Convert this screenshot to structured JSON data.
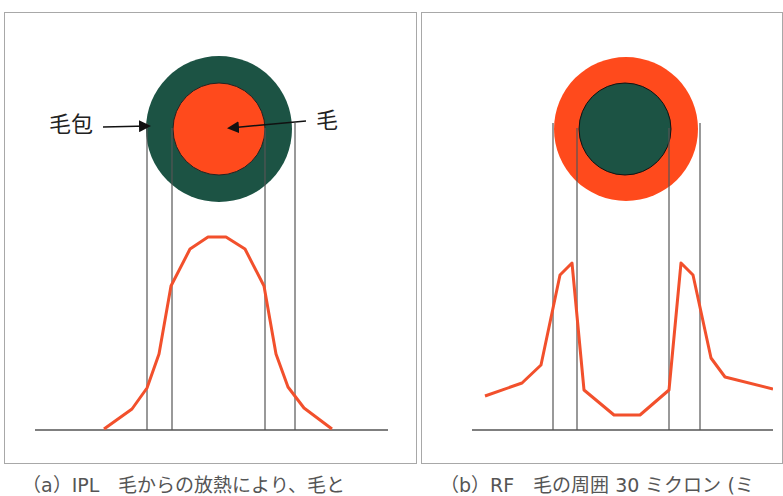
{
  "colors": {
    "follicle_green": "#1c5344",
    "hair_orange": "#ff4a1c",
    "curve_orange": "#f2502c",
    "line_gray": "#555555",
    "border_gray": "#a8a8a8"
  },
  "panel_a": {
    "labels": {
      "follicle": "毛包",
      "hair": "毛"
    },
    "outer_circle": {
      "cx": 219,
      "cy": 129,
      "r": 73,
      "fill": "follicle"
    },
    "inner_circle": {
      "cx": 219,
      "cy": 129,
      "r": 46,
      "fill": "hair"
    },
    "guide_lines_x": [
      147,
      172,
      265,
      295
    ],
    "baseline": {
      "x1": 35,
      "x2": 388,
      "y": 430
    },
    "curve_points": "104,429 132,409 147,388 159,354 171,286 190,249 208,237 226,237 245,249 264,286 276,354 288,387 304,408 332,429",
    "caption": "（a）IPL　毛からの放熱により、毛と"
  },
  "panel_b": {
    "outer_circle": {
      "cx": 626,
      "cy": 129,
      "r": 72,
      "fill": "hair"
    },
    "inner_circle": {
      "cx": 625,
      "cy": 129,
      "r": 46,
      "fill": "follicle"
    },
    "guide_lines_x": [
      553,
      577,
      669,
      700
    ],
    "baseline": {
      "x1": 472,
      "x2": 773,
      "y": 430
    },
    "curve_points": "485,396 522,383 541,365 560,275 572,263 584,390 614,415 640,415 669,390 681,263 693,275 711,358 725,377 773,389",
    "caption": "（b）RF　毛の周囲 30 ミクロン (ミ"
  },
  "chart_data": [
    {
      "type": "line",
      "title": "(a) IPL",
      "description": "Heat distribution profile across hair follicle cross-section: single peak centered on the hair",
      "annotations": [
        "毛包",
        "毛"
      ],
      "shape": "bell curve peaking over hair center"
    },
    {
      "type": "line",
      "title": "(b) RF",
      "description": "Heat distribution profile: two peaks located in the ring around the hair (follicle region), low in hair center",
      "annotations": [],
      "shape": "bimodal, peaks at follicle ring edges"
    }
  ]
}
